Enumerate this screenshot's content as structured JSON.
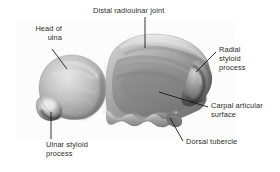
{
  "figure": {
    "background_color": "#ffffff",
    "bone_tone_light": "#d8d8d8",
    "bone_tone_mid": "#9a9a9a",
    "bone_tone_dark": "#4a4a4a",
    "label_color": "#2b2b2b",
    "leader_color": "#111111"
  },
  "labels": {
    "head_of_ulna": "Head of\nulna",
    "distal_radioulnar_joint": "Distal radioulnar joint",
    "radial_styloid_process": "Radial\nstyloid\nprocess",
    "carpal_articular_surface": "Carpal articular\nsurface",
    "dorsal_tubercle": "Dorsal tubercle",
    "ulnar_styloid_process": "Ulnar styloid\nprocess"
  },
  "structures": [
    {
      "name": "ulna-head",
      "label": "Head of ulna"
    },
    {
      "name": "distal-radioulnar-joint",
      "label": "Distal radioulnar joint"
    },
    {
      "name": "radial-styloid-process",
      "label": "Radial styloid process"
    },
    {
      "name": "carpal-articular-surface",
      "label": "Carpal articular surface"
    },
    {
      "name": "dorsal-tubercle",
      "label": "Dorsal tubercle"
    },
    {
      "name": "ulnar-styloid-process",
      "label": "Ulnar styloid process"
    }
  ]
}
